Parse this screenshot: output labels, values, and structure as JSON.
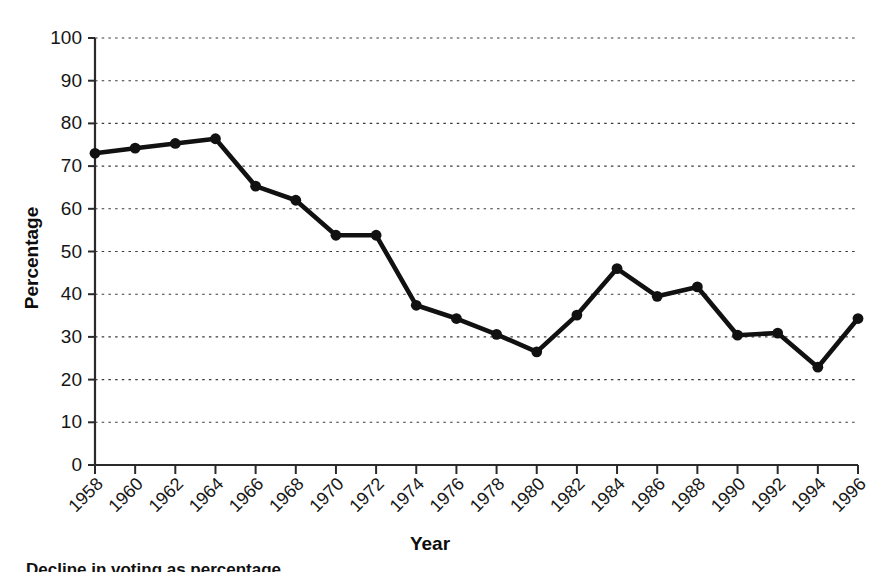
{
  "chart_data": {
    "type": "line",
    "title": "",
    "xlabel": "Year",
    "ylabel": "Percentage",
    "xlim": [
      1958,
      1996
    ],
    "ylim": [
      0,
      100
    ],
    "grid": true,
    "legend": "none",
    "x": [
      1958,
      1960,
      1962,
      1964,
      1966,
      1968,
      1970,
      1972,
      1974,
      1976,
      1978,
      1980,
      1982,
      1984,
      1986,
      1988,
      1990,
      1992,
      1994,
      1996
    ],
    "values": [
      73.0,
      74.2,
      75.3,
      76.4,
      65.3,
      62.0,
      53.8,
      53.8,
      37.4,
      34.3,
      30.6,
      26.5,
      35.1,
      46.0,
      39.5,
      41.7,
      30.4,
      30.9,
      22.9,
      34.3
    ],
    "xticklabels": [
      "1958",
      "1960",
      "1962",
      "1964",
      "1966",
      "1968",
      "1970",
      "1972",
      "1974",
      "1976",
      "1978",
      "1980",
      "1982",
      "1984",
      "1986",
      "1988",
      "1990",
      "1992",
      "1994",
      "1996"
    ],
    "yticks": [
      0,
      10,
      20,
      30,
      40,
      50,
      60,
      70,
      80,
      90,
      100
    ],
    "yticklabels": [
      "0",
      "10",
      "20",
      "30",
      "40",
      "50",
      "60",
      "70",
      "80",
      "90",
      "100"
    ],
    "series_color": "#111111",
    "grid_color": "#3a3a3a",
    "axis_color": "#2a2a2a",
    "marker": "circle"
  },
  "caption": {
    "text": "Decline in voting as percentage"
  }
}
